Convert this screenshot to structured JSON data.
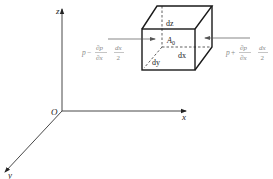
{
  "diagram": {
    "type": "fluid-element-pressure-forces",
    "axes": {
      "x_label": "x",
      "y_label": "y",
      "z_label": "z",
      "origin_label": "O"
    },
    "cube": {
      "dz_label": "dz",
      "dx_label": "dx",
      "dy_label": "dy",
      "center_label": "A",
      "center_subscript": "0"
    },
    "left_force": {
      "p": "p",
      "minus": "−",
      "partial_num": "∂p",
      "partial_den": "∂x",
      "frac_num": "dx",
      "frac_den": "2"
    },
    "right_force": {
      "p": "p",
      "plus": "+",
      "partial_num": "∂p",
      "partial_den": "∂x",
      "frac_num": "dx",
      "frac_den": "2"
    },
    "colors": {
      "line": "#1a1a1a",
      "force_label": "#8a8a8a",
      "arrow": "#555555"
    }
  }
}
